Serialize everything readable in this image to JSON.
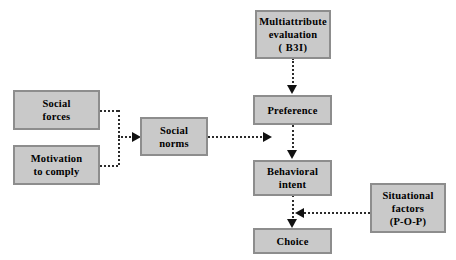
{
  "diagram": {
    "style": {
      "box_fill": "#c9c9c9",
      "box_border": "#8d8d8d",
      "line_color": "#2b2b2b",
      "arrow_color": "#111111",
      "background": "#ffffff",
      "text_color": "#000000"
    },
    "nodes": [
      {
        "id": "multiattribute-evaluation",
        "name": "node-multiattribute-evaluation",
        "lines": [
          "Multiattribute",
          "evaluation",
          "(  B3I)"
        ]
      },
      {
        "id": "social-forces",
        "name": "node-social-forces",
        "lines": [
          "Social",
          "forces"
        ]
      },
      {
        "id": "motivation-to-comply",
        "name": "node-motivation-to-comply",
        "lines": [
          "Motivation",
          "to comply"
        ]
      },
      {
        "id": "social-norms",
        "name": "node-social-norms",
        "lines": [
          "Social",
          "norms"
        ]
      },
      {
        "id": "preference",
        "name": "node-preference",
        "lines": [
          "Preference"
        ]
      },
      {
        "id": "behavioral-intent",
        "name": "node-behavioral-intent",
        "lines": [
          "Behavioral",
          "intent"
        ]
      },
      {
        "id": "situational-factors",
        "name": "node-situational-factors",
        "lines": [
          "Situational",
          "factors",
          "(P-O-P)"
        ]
      },
      {
        "id": "choice",
        "name": "node-choice",
        "lines": [
          "Choice"
        ]
      }
    ],
    "edges": [
      {
        "from": "multiattribute-evaluation",
        "to": "preference",
        "style": "dotted",
        "direction": "down"
      },
      {
        "from": "social-forces",
        "to": "social-norms",
        "style": "dotted",
        "direction": "right"
      },
      {
        "from": "motivation-to-comply",
        "to": "social-norms",
        "style": "dotted",
        "direction": "right"
      },
      {
        "from": "social-norms",
        "to": "behavioral-intent",
        "style": "dotted",
        "direction": "right"
      },
      {
        "from": "preference",
        "to": "behavioral-intent",
        "style": "dotted",
        "direction": "down"
      },
      {
        "from": "situational-factors",
        "to": "choice",
        "style": "dotted",
        "direction": "left"
      },
      {
        "from": "behavioral-intent",
        "to": "choice",
        "style": "dotted",
        "direction": "down"
      }
    ]
  }
}
